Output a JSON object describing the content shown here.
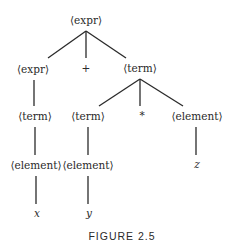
{
  "figure": {
    "caption": "FIGURE 2.5",
    "type": "parse-tree",
    "line_color": "#2a2a2a"
  },
  "nodes": [
    {
      "id": "n0",
      "label": "⟨expr⟩",
      "x": 86,
      "y": 20,
      "italic": false
    },
    {
      "id": "n1",
      "label": "⟨expr⟩",
      "x": 33,
      "y": 69,
      "italic": false
    },
    {
      "id": "n2",
      "label": "+",
      "x": 86,
      "y": 68,
      "italic": false
    },
    {
      "id": "n3",
      "label": "⟨term⟩",
      "x": 140,
      "y": 68,
      "italic": false
    },
    {
      "id": "n4",
      "label": "⟨term⟩",
      "x": 35,
      "y": 116,
      "italic": false
    },
    {
      "id": "n5",
      "label": "⟨term⟩",
      "x": 88,
      "y": 116,
      "italic": false
    },
    {
      "id": "n6",
      "label": "*",
      "x": 142,
      "y": 115,
      "italic": false
    },
    {
      "id": "n7",
      "label": "⟨element⟩",
      "x": 197,
      "y": 116,
      "italic": false
    },
    {
      "id": "n8",
      "label": "⟨element⟩",
      "x": 36,
      "y": 165,
      "italic": false
    },
    {
      "id": "n9",
      "label": "⟨element⟩",
      "x": 88,
      "y": 165,
      "italic": false
    },
    {
      "id": "n10",
      "label": "z",
      "x": 197,
      "y": 164,
      "italic": true
    },
    {
      "id": "n11",
      "label": "x",
      "x": 37,
      "y": 213,
      "italic": true
    },
    {
      "id": "n12",
      "label": "y",
      "x": 89,
      "y": 213,
      "italic": true
    }
  ],
  "edges": [
    {
      "from": "n0",
      "to": "n1",
      "x1": 86,
      "y1": 31,
      "x2": 48,
      "y2": 58
    },
    {
      "from": "n0",
      "to": "n2",
      "x1": 86,
      "y1": 31,
      "x2": 86,
      "y2": 58
    },
    {
      "from": "n0",
      "to": "n3",
      "x1": 86,
      "y1": 31,
      "x2": 126,
      "y2": 58
    },
    {
      "from": "n1",
      "to": "n4",
      "x1": 34,
      "y1": 80,
      "x2": 34,
      "y2": 106
    },
    {
      "from": "n3",
      "to": "n5",
      "x1": 140,
      "y1": 79,
      "x2": 99,
      "y2": 106
    },
    {
      "from": "n3",
      "to": "n6",
      "x1": 140,
      "y1": 79,
      "x2": 140,
      "y2": 106
    },
    {
      "from": "n3",
      "to": "n7",
      "x1": 140,
      "y1": 79,
      "x2": 183,
      "y2": 106
    },
    {
      "from": "n4",
      "to": "n8",
      "x1": 35,
      "y1": 127,
      "x2": 35,
      "y2": 155
    },
    {
      "from": "n5",
      "to": "n9",
      "x1": 88,
      "y1": 127,
      "x2": 88,
      "y2": 155
    },
    {
      "from": "n7",
      "to": "n10",
      "x1": 196,
      "y1": 127,
      "x2": 196,
      "y2": 155
    },
    {
      "from": "n8",
      "to": "n11",
      "x1": 36,
      "y1": 176,
      "x2": 36,
      "y2": 204
    },
    {
      "from": "n9",
      "to": "n12",
      "x1": 88,
      "y1": 176,
      "x2": 88,
      "y2": 204
    }
  ],
  "caption_pos": {
    "x": 122,
    "y": 236
  }
}
